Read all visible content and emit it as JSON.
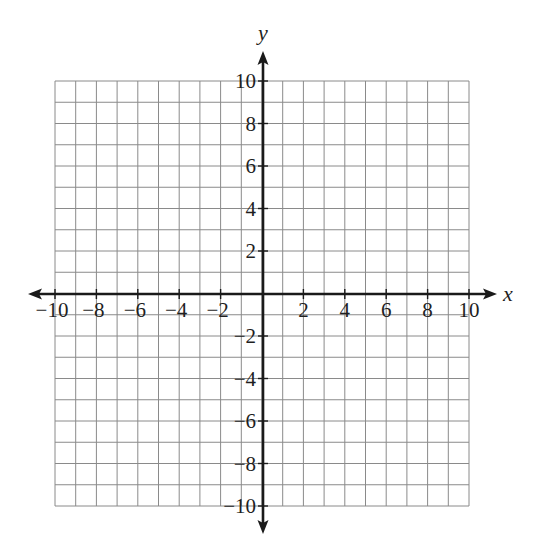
{
  "diagram": {
    "type": "coordinate-plane",
    "x_axis": {
      "label": "x",
      "min": -10,
      "max": 10,
      "grid_step": 1,
      "label_step": 2,
      "tick_labels": [
        "−10",
        "−8",
        "−6",
        "−4",
        "−2",
        "2",
        "4",
        "6",
        "8",
        "10"
      ]
    },
    "y_axis": {
      "label": "y",
      "min": -10,
      "max": 10,
      "grid_step": 1,
      "label_step": 2,
      "tick_labels": [
        "10",
        "8",
        "6",
        "4",
        "2",
        "−2",
        "−4",
        "−6",
        "−8",
        "−10"
      ]
    },
    "grid": true,
    "colors": {
      "grid": "#8a8a8a",
      "axis": "#1a1a1a",
      "text": "#1f1f1f",
      "background": "#ffffff"
    }
  },
  "labels": {
    "x_name": "x",
    "y_name": "y",
    "x_ticks": [
      {
        "v": -10,
        "t": "−10"
      },
      {
        "v": -8,
        "t": "−8"
      },
      {
        "v": -6,
        "t": "−6"
      },
      {
        "v": -4,
        "t": "−4"
      },
      {
        "v": -2,
        "t": "−2"
      },
      {
        "v": 2,
        "t": "2"
      },
      {
        "v": 4,
        "t": "4"
      },
      {
        "v": 6,
        "t": "6"
      },
      {
        "v": 8,
        "t": "8"
      },
      {
        "v": 10,
        "t": "10"
      }
    ],
    "y_ticks": [
      {
        "v": 10,
        "t": "10"
      },
      {
        "v": 8,
        "t": "8"
      },
      {
        "v": 6,
        "t": "6"
      },
      {
        "v": 4,
        "t": "4"
      },
      {
        "v": 2,
        "t": "2"
      },
      {
        "v": -2,
        "t": "−2"
      },
      {
        "v": -4,
        "t": "−4"
      },
      {
        "v": -6,
        "t": "−6"
      },
      {
        "v": -8,
        "t": "−8"
      },
      {
        "v": -10,
        "t": "−10"
      }
    ]
  }
}
